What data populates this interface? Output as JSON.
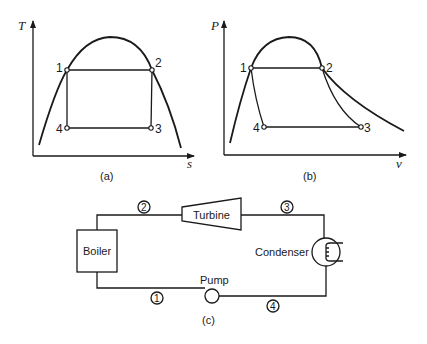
{
  "diagram_a": {
    "y_axis_label": "T",
    "x_axis_label": "s",
    "caption": "(a)",
    "points": [
      "1",
      "2",
      "3",
      "4"
    ]
  },
  "diagram_b": {
    "y_axis_label": "P",
    "x_axis_label": "v",
    "caption": "(b)",
    "points": [
      "1",
      "2",
      "3",
      "4"
    ]
  },
  "diagram_c": {
    "caption": "(c)",
    "components": {
      "boiler": "Boiler",
      "turbine": "Turbine",
      "condenser": "Condenser",
      "pump": "Pump"
    },
    "state_labels": [
      "1",
      "2",
      "3",
      "4"
    ]
  }
}
